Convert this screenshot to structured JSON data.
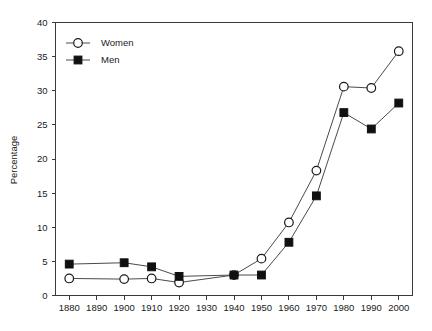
{
  "chart_data": {
    "type": "line",
    "title": "",
    "xlabel": "",
    "ylabel": "Percentage",
    "xlim": [
      1875,
      2005
    ],
    "ylim": [
      0,
      40
    ],
    "grid": false,
    "legend_position": "top-left",
    "x_ticks": [
      1880,
      1890,
      1900,
      1910,
      1920,
      1930,
      1940,
      1950,
      1960,
      1970,
      1980,
      1990,
      2000
    ],
    "y_ticks": [
      0,
      5,
      10,
      15,
      20,
      25,
      30,
      35,
      40
    ],
    "x": [
      1880,
      1900,
      1910,
      1920,
      1940,
      1950,
      1960,
      1970,
      1980,
      1990,
      2000
    ],
    "series": [
      {
        "name": "Women",
        "marker": "open-circle",
        "values": [
          2.5,
          2.4,
          2.5,
          1.9,
          3.0,
          5.4,
          10.7,
          18.3,
          30.6,
          30.4,
          35.8
        ]
      },
      {
        "name": "Men",
        "marker": "filled-square",
        "values": [
          4.6,
          4.8,
          4.2,
          2.8,
          3.0,
          3.0,
          7.8,
          14.6,
          26.8,
          24.4,
          28.2
        ]
      }
    ]
  },
  "axis": {
    "y_title": "Percentage"
  },
  "legend": {
    "items": [
      {
        "label": "Women"
      },
      {
        "label": "Men"
      }
    ]
  }
}
